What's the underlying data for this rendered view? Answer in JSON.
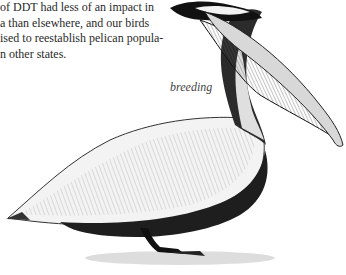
{
  "body_text": {
    "lines": [
      "of DDT had less of an impact in",
      "a than elsewhere, and our birds",
      "ised to reestablish pelican popula-",
      "n other states."
    ]
  },
  "figure": {
    "caption": "breeding"
  }
}
